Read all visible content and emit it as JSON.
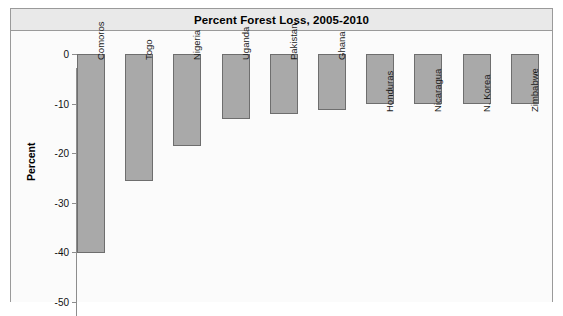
{
  "chart_data": {
    "type": "bar",
    "title": "Percent Forest Loss, 2005-2010",
    "xlabel": "",
    "ylabel": "Percent",
    "ylim": [
      -50,
      0
    ],
    "yticks": [
      0,
      -10,
      -20,
      -30,
      -40,
      -50
    ],
    "ytick_labels": [
      "0",
      "-10",
      "-20",
      "-30",
      "-40",
      "-50"
    ],
    "grid": false,
    "legend": "none",
    "orientation": "vertical-downward",
    "categories": [
      "Comoros",
      "Togo",
      "Nigeria",
      "Uganda",
      "Pakistan",
      "Ghana",
      "Honduras",
      "Nicaragua",
      "N. Korea",
      "Zimbabwe"
    ],
    "values": [
      -40.1,
      -25.6,
      -18.6,
      -13.1,
      -12.1,
      -11.3,
      -10.1,
      -10.1,
      -10.0,
      -10.0
    ],
    "bar_color": "#a9a9a9",
    "bar_border_color": "#6e6e6e",
    "label_placement": [
      "inside",
      "inside",
      "inside",
      "inside",
      "inside",
      "inside",
      "below",
      "below",
      "below",
      "below"
    ]
  },
  "frame": {
    "background": "#fdfdfd",
    "border_color": "#9a9a9a",
    "title_band_color": "#e9e9e9"
  }
}
